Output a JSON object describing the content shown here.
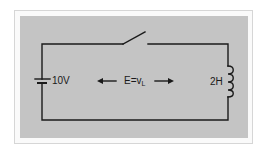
{
  "diagram": {
    "type": "circuit",
    "colors": {
      "background": "#ffffff",
      "frame_border": "#d6d6d6",
      "panel": "#c4c4c4",
      "wire": "#1a1a1a"
    },
    "components": {
      "battery": {
        "label": "10V"
      },
      "switch": {
        "state": "open"
      },
      "inductor": {
        "label": "2H"
      }
    },
    "annotation": {
      "text": "E=v",
      "subscript": "L",
      "arrows": [
        "left",
        "right"
      ]
    }
  }
}
